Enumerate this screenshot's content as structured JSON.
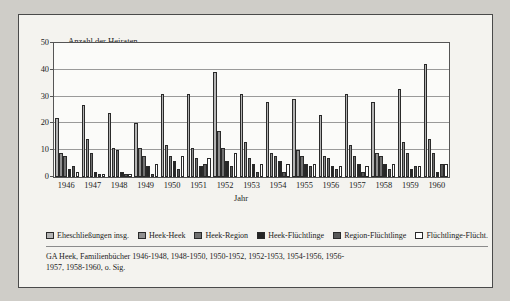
{
  "figure": {
    "y_axis_title": "Anzahl der Heiraten",
    "x_axis_title": "Jahr",
    "source_note": "GA Heek, Familienbücher 1946-1948, 1948-1950, 1950-1952, 1952-1953, 1954-1956, 1956-1957, 1958-1960, o. Sig."
  },
  "colors": {
    "series0": "#b4b4b4",
    "series1": "#8f8f8f",
    "series2": "#707070",
    "series3": "#262626",
    "series4": "#585858",
    "series5": "#ffffff",
    "grid": "#9a9a9a",
    "axis": "#555555",
    "page_background": "#cfcdc8",
    "figure_background": "#f4f3ef"
  },
  "chart_data": {
    "type": "bar",
    "title": "",
    "xlabel": "Jahr",
    "ylabel": "Anzahl der Heiraten",
    "ylim": [
      0,
      50
    ],
    "yticks": [
      0,
      10,
      20,
      30,
      40,
      50
    ],
    "grid": true,
    "legend_position": "bottom",
    "categories": [
      "1946",
      "1947",
      "1948",
      "1949",
      "1950",
      "1951",
      "1952",
      "1953",
      "1954",
      "1955",
      "1956",
      "1957",
      "1958",
      "1959",
      "1960"
    ],
    "series": [
      {
        "name": "Eheschließungen insg.",
        "values": [
          22,
          27,
          24,
          20,
          31,
          31,
          39,
          31,
          28,
          29,
          23,
          31,
          28,
          33,
          42
        ]
      },
      {
        "name": "Heek-Heek",
        "values": [
          9,
          14,
          11,
          11,
          12,
          11,
          17,
          13,
          9,
          10,
          8,
          12,
          9,
          13,
          14
        ]
      },
      {
        "name": "Heek-Region",
        "values": [
          8,
          9,
          10,
          8,
          8,
          7,
          11,
          7,
          8,
          8,
          7,
          8,
          8,
          9,
          9
        ]
      },
      {
        "name": "Heek-Flüchtlinge",
        "values": [
          3,
          2,
          2,
          4,
          6,
          4,
          6,
          5,
          6,
          5,
          4,
          5,
          5,
          3,
          2
        ]
      },
      {
        "name": "Region-Flüchtlinge",
        "values": [
          4,
          1,
          1,
          1,
          3,
          5,
          4,
          2,
          2,
          4,
          3,
          2,
          3,
          4,
          5
        ]
      },
      {
        "name": "Flüchtlinge-Flücht.",
        "values": [
          2,
          1,
          1,
          5,
          8,
          7,
          9,
          5,
          5,
          5,
          4,
          4,
          5,
          4,
          5
        ]
      }
    ]
  },
  "legend": [
    {
      "label": "Eheschließungen insg.",
      "swatch": "series0"
    },
    {
      "label": "Heek-Heek",
      "swatch": "series1"
    },
    {
      "label": "Heek-Region",
      "swatch": "series2"
    },
    {
      "label": "Heek-Flüchtlinge",
      "swatch": "series3"
    },
    {
      "label": "Region-Flüchtlinge",
      "swatch": "series4"
    },
    {
      "label": "Flüchtlinge-Flücht.",
      "swatch": "series5"
    }
  ]
}
